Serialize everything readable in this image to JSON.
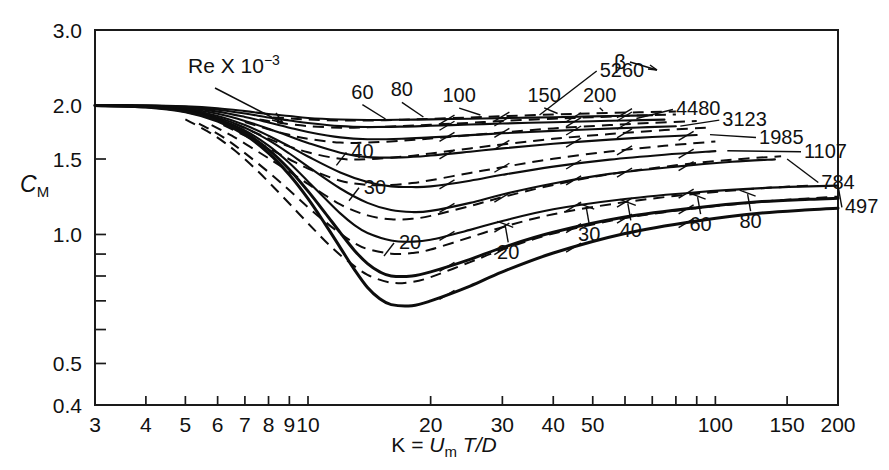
{
  "chart_data": {
    "type": "line",
    "title": "",
    "xlabel": "K = Um T/D",
    "ylabel": "CM",
    "xscale": "log",
    "yscale": "log",
    "xlim": [
      3,
      200
    ],
    "ylim": [
      0.4,
      3.0
    ],
    "xticklabels": [
      "3",
      "4",
      "5",
      "6",
      "7",
      "8",
      "9",
      "10",
      "20",
      "30",
      "40",
      "50",
      "100",
      "150",
      "200"
    ],
    "xtickvalues": [
      3,
      4,
      5,
      6,
      7,
      8,
      9,
      10,
      20,
      30,
      40,
      50,
      100,
      150,
      200
    ],
    "yticklabels": [
      "3.0",
      "2.0",
      "1.5",
      "1.0",
      "0.5",
      "0.4"
    ],
    "ytickvalues": [
      3.0,
      2.0,
      1.5,
      1.0,
      0.5,
      0.4
    ],
    "yminorticks": [
      0.9,
      0.8,
      0.7,
      0.6
    ],
    "grid": false,
    "legend": "inline-curve-labels",
    "annotations": [
      {
        "name": "re-legend",
        "text": "Re X 10",
        "sup": "-3",
        "x": 3.9,
        "y": 2.45
      },
      {
        "name": "beta-legend",
        "text": "β",
        "x": 44,
        "y": 2.62
      }
    ],
    "series": [
      {
        "name": "beta-5260",
        "family": "beta",
        "label": "5260",
        "style": "solid",
        "x": [
          3,
          4,
          5,
          6,
          7,
          8,
          9,
          10,
          12,
          14,
          17,
          20,
          25,
          30,
          40,
          50,
          60,
          70
        ],
        "y": [
          2.0,
          2.0,
          1.99,
          1.97,
          1.94,
          1.91,
          1.89,
          1.87,
          1.855,
          1.85,
          1.852,
          1.856,
          1.862,
          1.868,
          1.878,
          1.886,
          1.892,
          1.897
        ]
      },
      {
        "name": "beta-4480",
        "family": "beta",
        "label": "4480",
        "style": "solid",
        "x": [
          3,
          4,
          5,
          6,
          7,
          8,
          9,
          10,
          12,
          14,
          17,
          20,
          25,
          30,
          40,
          50,
          60,
          75
        ],
        "y": [
          2.0,
          2.0,
          1.985,
          1.955,
          1.915,
          1.875,
          1.845,
          1.82,
          1.79,
          1.781,
          1.785,
          1.793,
          1.805,
          1.815,
          1.828,
          1.838,
          1.845,
          1.853
        ]
      },
      {
        "name": "beta-3123",
        "family": "beta",
        "label": "3123",
        "style": "solid",
        "x": [
          3,
          4,
          5,
          6,
          7,
          8,
          9,
          10,
          12,
          14,
          17,
          20,
          25,
          30,
          40,
          50,
          65,
          80
        ],
        "y": [
          2.0,
          1.998,
          1.977,
          1.935,
          1.88,
          1.825,
          1.775,
          1.735,
          1.685,
          1.668,
          1.672,
          1.685,
          1.705,
          1.722,
          1.745,
          1.76,
          1.777,
          1.788
        ]
      },
      {
        "name": "beta-1985",
        "family": "beta",
        "label": "1985",
        "style": "solid",
        "x": [
          3,
          4,
          5,
          6,
          7,
          8,
          9,
          10,
          12,
          14,
          17,
          20,
          25,
          30,
          40,
          55,
          70,
          90
        ],
        "y": [
          2.0,
          1.995,
          1.968,
          1.912,
          1.84,
          1.765,
          1.695,
          1.635,
          1.552,
          1.515,
          1.513,
          1.528,
          1.56,
          1.588,
          1.628,
          1.665,
          1.688,
          1.707
        ]
      },
      {
        "name": "beta-1107",
        "family": "beta",
        "label": "1107",
        "style": "solid",
        "x": [
          3,
          4,
          5,
          6,
          7,
          8,
          9,
          10,
          12,
          14,
          16,
          18,
          20,
          25,
          30,
          40,
          55,
          75,
          100
        ],
        "y": [
          2.0,
          1.992,
          1.958,
          1.89,
          1.8,
          1.7,
          1.605,
          1.52,
          1.395,
          1.325,
          1.295,
          1.29,
          1.295,
          1.335,
          1.378,
          1.44,
          1.495,
          1.535,
          1.565
        ]
      },
      {
        "name": "beta-784",
        "family": "beta",
        "label": "784",
        "style": "solid",
        "x": [
          3,
          4,
          5,
          6,
          7,
          8,
          9,
          10,
          12,
          14,
          16,
          18,
          20,
          25,
          30,
          40,
          55,
          80,
          110,
          140
        ],
        "y": [
          2.0,
          1.99,
          1.95,
          1.875,
          1.775,
          1.66,
          1.545,
          1.44,
          1.28,
          1.185,
          1.14,
          1.128,
          1.135,
          1.185,
          1.24,
          1.315,
          1.385,
          1.44,
          1.478,
          1.497
        ]
      },
      {
        "name": "beta-497",
        "family": "beta",
        "label": "497",
        "style": "solid",
        "x": [
          3,
          4,
          5,
          6,
          7,
          8,
          9,
          10,
          11,
          12,
          13,
          14,
          16,
          18,
          20,
          25,
          30,
          40,
          60,
          90,
          130,
          170,
          200
        ],
        "y": [
          2.0,
          1.988,
          1.944,
          1.862,
          1.748,
          1.612,
          1.468,
          1.33,
          1.215,
          1.12,
          1.052,
          1.008,
          0.968,
          0.962,
          0.972,
          1.025,
          1.075,
          1.145,
          1.21,
          1.255,
          1.283,
          1.295,
          1.3
        ]
      },
      {
        "name": "beta-lowest-a",
        "family": "beta",
        "label": "",
        "style": "solid-thick",
        "x": [
          3,
          4,
          5,
          6,
          7,
          8,
          9,
          10,
          11,
          12,
          13,
          14,
          15,
          16,
          18,
          20,
          25,
          30,
          40,
          60,
          90,
          130,
          170,
          200
        ],
        "y": [
          2.0,
          1.986,
          1.938,
          1.85,
          1.728,
          1.578,
          1.418,
          1.262,
          1.125,
          1.01,
          0.918,
          0.855,
          0.818,
          0.8,
          0.8,
          0.818,
          0.875,
          0.932,
          1.012,
          1.098,
          1.155,
          1.193,
          1.208,
          1.215
        ]
      },
      {
        "name": "beta-lowest-b",
        "family": "beta",
        "label": "",
        "style": "solid-thick",
        "x": [
          3,
          4,
          5,
          6,
          7,
          8,
          9,
          10,
          11,
          12,
          13,
          14,
          15,
          16,
          18,
          20,
          25,
          30,
          40,
          60,
          90,
          130,
          170,
          200
        ],
        "y": [
          2.0,
          1.984,
          1.932,
          1.838,
          1.708,
          1.548,
          1.378,
          1.212,
          1.06,
          0.932,
          0.828,
          0.752,
          0.708,
          0.686,
          0.682,
          0.7,
          0.758,
          0.818,
          0.905,
          1.005,
          1.075,
          1.122,
          1.142,
          1.152
        ]
      },
      {
        "name": "re-200",
        "family": "re",
        "label": "200",
        "style": "dashed",
        "x": [
          8.2,
          9,
          10,
          12,
          14,
          17,
          20,
          25,
          30,
          40,
          50,
          65,
          80
        ],
        "y": [
          1.875,
          1.866,
          1.855,
          1.845,
          1.845,
          1.852,
          1.861,
          1.875,
          1.888,
          1.905,
          1.917,
          1.928,
          1.935
        ]
      },
      {
        "name": "re-150",
        "family": "re",
        "label": "150",
        "style": "dashed",
        "x": [
          7.6,
          8.5,
          10,
          12,
          14,
          17,
          20,
          25,
          30,
          40,
          50,
          65,
          80
        ],
        "y": [
          1.855,
          1.822,
          1.79,
          1.775,
          1.778,
          1.79,
          1.803,
          1.822,
          1.84,
          1.862,
          1.878,
          1.895,
          1.905
        ]
      },
      {
        "name": "re-100",
        "family": "re",
        "label": "100",
        "style": "dashed",
        "x": [
          7,
          8,
          9,
          10,
          12,
          14,
          17,
          20,
          25,
          30,
          40,
          55,
          70,
          90
        ],
        "y": [
          1.83,
          1.76,
          1.708,
          1.672,
          1.638,
          1.638,
          1.655,
          1.675,
          1.705,
          1.73,
          1.768,
          1.8,
          1.822,
          1.84
        ]
      },
      {
        "name": "re-80",
        "family": "re",
        "label": "80",
        "style": "dashed",
        "x": [
          6.6,
          7.5,
          8.5,
          10,
          12,
          14,
          17,
          20,
          25,
          30,
          40,
          55,
          75,
          95
        ],
        "y": [
          1.815,
          1.72,
          1.635,
          1.555,
          1.502,
          1.498,
          1.518,
          1.545,
          1.588,
          1.622,
          1.672,
          1.715,
          1.752,
          1.775
        ]
      },
      {
        "name": "re-60",
        "family": "re",
        "label": "60",
        "style": "dashed",
        "x": [
          6.2,
          7,
          8,
          9,
          10,
          12,
          14,
          16,
          18,
          20,
          25,
          30,
          40,
          55,
          75,
          100
        ],
        "y": [
          1.8,
          1.7,
          1.59,
          1.498,
          1.425,
          1.335,
          1.305,
          1.305,
          1.318,
          1.338,
          1.392,
          1.435,
          1.502,
          1.562,
          1.61,
          1.648
        ]
      },
      {
        "name": "re-40",
        "family": "re",
        "label": "40",
        "style": "dashed",
        "x": [
          5.8,
          6.5,
          7.5,
          8.5,
          10,
          12,
          14,
          16,
          18,
          20,
          25,
          30,
          40,
          55,
          80,
          110,
          145
        ],
        "y": [
          1.8,
          1.7,
          1.565,
          1.452,
          1.312,
          1.175,
          1.108,
          1.085,
          1.088,
          1.105,
          1.165,
          1.222,
          1.305,
          1.382,
          1.45,
          1.495,
          1.522
        ]
      },
      {
        "name": "re-30",
        "family": "re",
        "label": "30",
        "style": "dashed",
        "x": [
          5.4,
          6.2,
          7,
          8,
          9,
          10,
          11,
          12,
          13,
          14,
          16,
          18,
          20,
          25,
          30,
          40,
          60,
          90,
          130,
          175
        ],
        "y": [
          1.815,
          1.685,
          1.548,
          1.398,
          1.268,
          1.158,
          1.072,
          1.005,
          0.955,
          0.925,
          0.902,
          0.905,
          0.922,
          0.985,
          1.04,
          1.115,
          1.19,
          1.245,
          1.282,
          1.302
        ]
      },
      {
        "name": "re-20",
        "family": "re",
        "label": "20",
        "style": "dashed",
        "x": [
          5.0,
          5.8,
          6.6,
          7.5,
          8.5,
          9.5,
          10.5,
          11.5,
          12.5,
          14,
          16,
          18,
          20,
          25,
          30,
          40,
          60,
          90,
          130,
          180,
          200
        ],
        "y": [
          1.855,
          1.718,
          1.572,
          1.41,
          1.25,
          1.118,
          1.012,
          0.928,
          0.868,
          0.805,
          0.772,
          0.775,
          0.795,
          0.862,
          0.922,
          1.005,
          1.092,
          1.152,
          1.192,
          1.218,
          1.225
        ]
      }
    ],
    "re_upper_labels": [
      {
        "name": "re-label-60",
        "text": "60",
        "x": 13.6,
        "y": 2.075,
        "tx": 15.5,
        "ty": 1.86
      },
      {
        "name": "re-label-80",
        "text": "80",
        "x": 17.0,
        "y": 2.1,
        "tx": 19.2,
        "ty": 1.88
      },
      {
        "name": "re-label-100",
        "text": "100",
        "x": 23.5,
        "y": 2.035,
        "tx": 26.5,
        "ty": 1.9
      },
      {
        "name": "re-label-150",
        "text": "150",
        "x": 38.0,
        "y": 2.04,
        "tx": 41.0,
        "ty": 1.915
      },
      {
        "name": "re-label-200",
        "text": "200",
        "x": 52.0,
        "y": 2.04,
        "tx": 53.0,
        "ty": 1.94
      }
    ],
    "re_mid_labels": [
      {
        "name": "re-label-40",
        "text": "40",
        "x": 13.6,
        "y": 1.505
      },
      {
        "name": "re-label-30",
        "text": "30",
        "x": 14.6,
        "y": 1.245
      },
      {
        "name": "re-label-20",
        "text": "20",
        "x": 17.8,
        "y": 0.925
      }
    ],
    "re_lower_labels": [
      {
        "name": "re-label-low-20",
        "text": "20",
        "x": 31,
        "y": 0.875
      },
      {
        "name": "re-label-low-30",
        "text": "30",
        "x": 49,
        "y": 0.965
      },
      {
        "name": "re-label-low-40",
        "text": "40",
        "x": 62,
        "y": 0.985
      },
      {
        "name": "re-label-low-60",
        "text": "60",
        "x": 92,
        "y": 1.018
      },
      {
        "name": "re-label-low-80",
        "text": "80",
        "x": 122,
        "y": 1.035
      }
    ],
    "beta_labels": [
      {
        "name": "beta-label-5260",
        "text": "5260",
        "x": 52,
        "y": 2.33,
        "lx": 37,
        "ly": 1.9
      },
      {
        "name": "beta-label-4480",
        "text": "4480",
        "x": 80,
        "y": 1.895,
        "lx": 64,
        "ly": 1.865
      },
      {
        "name": "beta-label-3123",
        "text": "3123",
        "x": 104,
        "y": 1.79,
        "lx": 82,
        "ly": 1.79
      },
      {
        "name": "beta-label-1985",
        "text": "1985",
        "x": 128,
        "y": 1.63,
        "lx": 97,
        "ly": 1.71
      },
      {
        "name": "beta-label-1107",
        "text": "1107",
        "x": 165,
        "y": 1.51,
        "lx": 107,
        "ly": 1.568
      },
      {
        "name": "beta-label-784",
        "text": "784",
        "x": 182,
        "y": 1.28,
        "lx": 150,
        "ly": 1.5
      },
      {
        "name": "beta-label-497",
        "text": "497",
        "x": 208,
        "y": 1.12,
        "lx": 200,
        "ly": 1.3
      }
    ]
  },
  "figure": {
    "caption": "",
    "y_axis_label_c": "C",
    "y_axis_label_sub": "M",
    "x_axis_label_k": "K = ",
    "x_axis_label_u": "U",
    "x_axis_label_m": "m",
    "x_axis_label_td": "T/D",
    "re_legend_text": "Re X 10",
    "re_legend_exp": "−3",
    "beta_symbol": "β"
  }
}
